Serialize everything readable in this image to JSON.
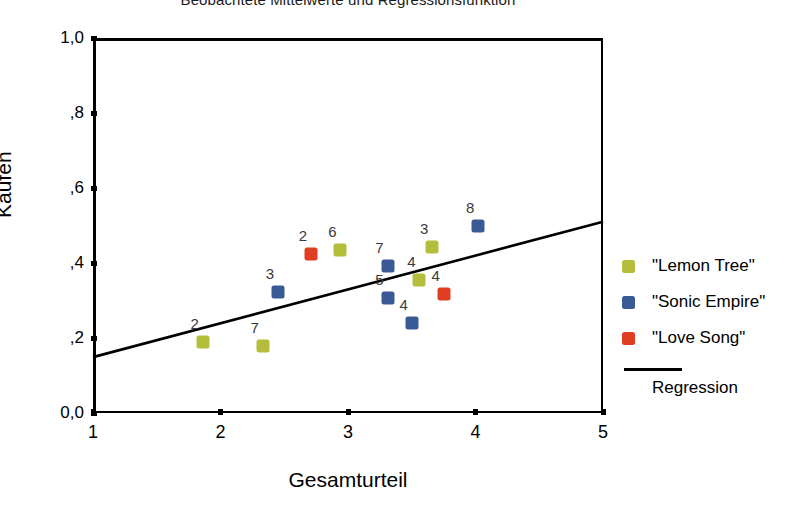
{
  "chart_data": {
    "type": "scatter",
    "title": "Beobachtete Mittelwerte und Regressionsfunktion",
    "xlabel": "Gesamturteil",
    "ylabel": "Kaufen",
    "xlim": [
      1,
      5
    ],
    "ylim": [
      0.0,
      1.0
    ],
    "xticks": [
      "1",
      "2",
      "3",
      "4",
      "5"
    ],
    "xtick_values": [
      1,
      2,
      3,
      4,
      5
    ],
    "yticks": [
      "0,0",
      ",2",
      ",4",
      ",6",
      ",8",
      "1,0"
    ],
    "ytick_values": [
      0.0,
      0.2,
      0.4,
      0.6,
      0.8,
      1.0
    ],
    "grid": false,
    "legend_position": "right",
    "series": [
      {
        "name": "\"Lemon Tree\"",
        "color": "#b5bd3c",
        "points": [
          {
            "label": "2",
            "x": 1.86,
            "y": 0.19
          },
          {
            "label": "7",
            "x": 2.33,
            "y": 0.18
          },
          {
            "label": "6",
            "x": 2.94,
            "y": 0.435
          },
          {
            "label": "4",
            "x": 3.56,
            "y": 0.355
          },
          {
            "label": "3",
            "x": 3.66,
            "y": 0.443
          }
        ]
      },
      {
        "name": "\"Sonic Empire\"",
        "color": "#3a5a96",
        "points": [
          {
            "label": "3",
            "x": 2.45,
            "y": 0.322
          },
          {
            "label": "7",
            "x": 3.31,
            "y": 0.392
          },
          {
            "label": "5",
            "x": 3.31,
            "y": 0.308
          },
          {
            "label": "4",
            "x": 3.5,
            "y": 0.24
          },
          {
            "label": "8",
            "x": 4.02,
            "y": 0.5
          }
        ]
      },
      {
        "name": "\"Love Song\"",
        "color": "#e03e22",
        "points": [
          {
            "label": "2",
            "x": 2.71,
            "y": 0.425
          },
          {
            "label": "4",
            "x": 3.75,
            "y": 0.318
          }
        ]
      }
    ],
    "regression": {
      "name": "Regression",
      "color": "#000000",
      "x_start": 1.0,
      "y_start": 0.149,
      "x_end": 5.0,
      "y_end": 0.51
    }
  },
  "legend": {
    "items": [
      {
        "label": "\"Lemon Tree\"",
        "color": "#b5bd3c"
      },
      {
        "label": "\"Sonic Empire\"",
        "color": "#3a5a96"
      },
      {
        "label": "\"Love Song\"",
        "color": "#e03e22"
      }
    ],
    "regression_label": "Regression"
  }
}
